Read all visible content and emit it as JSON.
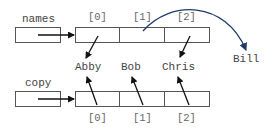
{
  "diagram": {
    "variables": [
      {
        "name": "names",
        "label": "names"
      },
      {
        "name": "copy",
        "label": "copy"
      }
    ],
    "top_array": {
      "indices": [
        "[0]",
        "[1]",
        "[2]"
      ]
    },
    "bottom_array": {
      "indices": [
        "[0]",
        "[1]",
        "[2]"
      ]
    },
    "strings": [
      "Abby",
      "Bob",
      "Chris"
    ],
    "new_string": "Bill",
    "colors": {
      "box_stroke": "#555555",
      "arrow": "#111111",
      "curved_arrow": "#1f3a6b",
      "text": "#444444"
    }
  }
}
